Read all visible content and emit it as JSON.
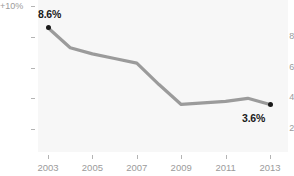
{
  "chart_data": {
    "type": "line",
    "title": "",
    "subtitle": "",
    "xlabel": "",
    "ylabel": "",
    "x": [
      2003,
      2004,
      2005,
      2006,
      2007,
      2008,
      2009,
      2010,
      2011,
      2012,
      2013
    ],
    "values": [
      8.6,
      7.3,
      6.9,
      6.6,
      6.3,
      4.9,
      3.6,
      3.7,
      3.8,
      4.0,
      3.6
    ],
    "series": [
      {
        "name": "rate",
        "values": [
          8.6,
          7.3,
          6.9,
          6.6,
          6.3,
          4.9,
          3.6,
          3.7,
          3.8,
          4.0,
          3.6
        ]
      }
    ],
    "xlim": [
      2003,
      2013
    ],
    "ylim": [
      1.2,
      10.0
    ],
    "grid": false,
    "legend": "none",
    "line_color": "#9b9b9b",
    "marker_color": "#1a1a1a",
    "plot_background": "#f7f7f7",
    "page_background": "#ffffff",
    "tick_color": "#9b9b9b",
    "y_axis": {
      "top_label": "+10%",
      "ticks": [
        {
          "label": "8",
          "value": 8
        },
        {
          "label": "6",
          "value": 6
        },
        {
          "label": "4",
          "value": 4
        },
        {
          "label": "2",
          "value": 2
        }
      ]
    },
    "x_axis": {
      "ticks": [
        {
          "label": "2003",
          "value": 2003
        },
        {
          "label": "2005",
          "value": 2005
        },
        {
          "label": "2007",
          "value": 2007
        },
        {
          "label": "2009",
          "value": 2009
        },
        {
          "label": "2011",
          "value": 2011
        },
        {
          "label": "2013",
          "value": 2013
        }
      ]
    },
    "annotations": [
      {
        "label": "8.6%",
        "x": 2003,
        "y": 8.6
      },
      {
        "label": "3.6%",
        "x": 2013,
        "y": 3.6
      }
    ]
  }
}
